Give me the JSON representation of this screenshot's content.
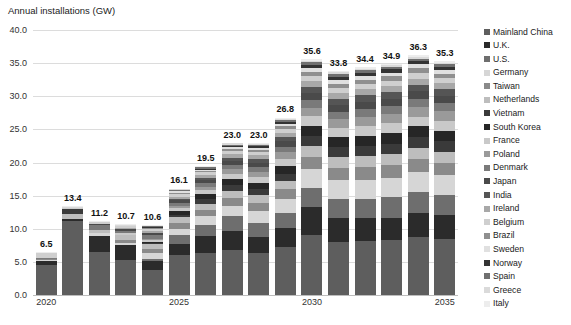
{
  "chart_data": {
    "type": "bar",
    "stacked": true,
    "title": "Annual installations (GW)",
    "xlabel": "",
    "ylabel": "Annual installations (GW)",
    "ylim": [
      0,
      40
    ],
    "ytick_step": 5,
    "ytick_labels": [
      "0.0",
      "5.0",
      "10.0",
      "15.0",
      "20.0",
      "25.0",
      "30.0",
      "35.0",
      "40.0"
    ],
    "grid": true,
    "legend_position": "right",
    "categories": [
      "2020",
      "2021",
      "2022",
      "2023",
      "2024",
      "2025",
      "2026",
      "2027",
      "2028",
      "2029",
      "2030",
      "2031",
      "2032",
      "2033",
      "2034",
      "2035"
    ],
    "xtick_labels_shown": [
      "2020",
      "2025",
      "2030",
      "2035"
    ],
    "totals": [
      6.5,
      13.4,
      11.2,
      10.7,
      10.6,
      16.1,
      19.5,
      23.0,
      23.0,
      26.8,
      35.6,
      33.8,
      34.4,
      34.9,
      36.3,
      35.3
    ],
    "total_labels": [
      "6.5",
      "13.4",
      "11.2",
      "10.7",
      "10.6",
      "16.1",
      "19.5",
      "23.0",
      "23.0",
      "26.8",
      "35.6",
      "33.8",
      "34.4",
      "34.9",
      "36.3",
      "35.3"
    ],
    "series": [
      {
        "name": "Mainland China",
        "color": "#5e5e5e",
        "values": [
          4.5,
          11.1,
          5.9,
          5.0,
          3.6,
          6.0,
          6.5,
          7.0,
          7.0,
          8.0,
          9.5,
          8.4,
          8.8,
          8.8,
          9.4,
          9.0
        ]
      },
      {
        "name": "U.K.",
        "color": "#2b2b2b",
        "values": [
          0.6,
          0.3,
          2.2,
          2.0,
          1.2,
          1.6,
          2.6,
          3.0,
          2.6,
          3.2,
          4.6,
          3.9,
          3.6,
          3.7,
          4.0,
          3.9
        ]
      },
      {
        "name": "U.S.",
        "color": "#6e6e6e",
        "values": [
          0.0,
          0.0,
          0.0,
          0.1,
          0.4,
          1.3,
          1.7,
          2.3,
          2.4,
          2.6,
          3.0,
          3.1,
          3.2,
          3.3,
          3.4,
          3.3
        ]
      },
      {
        "name": "Germany",
        "color": "#d6d6d6",
        "values": [
          0.2,
          0.0,
          0.3,
          0.3,
          0.8,
          1.0,
          1.3,
          1.6,
          2.0,
          2.3,
          3.0,
          3.0,
          3.1,
          3.1,
          3.2,
          3.1
        ]
      },
      {
        "name": "Taiwan",
        "color": "#8a8a8a",
        "values": [
          0.1,
          0.1,
          0.1,
          0.3,
          0.6,
          0.8,
          1.0,
          1.2,
          1.4,
          1.6,
          1.9,
          1.9,
          2.0,
          2.0,
          2.1,
          2.0
        ]
      },
      {
        "name": "Netherlands",
        "color": "#bdbdbd",
        "values": [
          0.0,
          0.7,
          0.4,
          0.7,
          0.7,
          0.9,
          1.0,
          1.1,
          1.2,
          1.4,
          1.8,
          1.7,
          1.8,
          1.8,
          1.9,
          1.8
        ]
      },
      {
        "name": "Vietnam",
        "color": "#3a3a3a",
        "values": [
          0.0,
          0.8,
          0.0,
          0.0,
          0.1,
          0.4,
          0.7,
          0.9,
          1.0,
          1.2,
          1.6,
          1.6,
          1.7,
          1.7,
          1.8,
          1.7
        ]
      },
      {
        "name": "South Korea",
        "color": "#262626",
        "values": [
          0.0,
          0.0,
          0.0,
          0.1,
          0.2,
          0.5,
          0.7,
          0.9,
          1.1,
          1.3,
          1.6,
          1.6,
          1.6,
          1.7,
          1.7,
          1.7
        ]
      },
      {
        "name": "France",
        "color": "#c9c9c9",
        "values": [
          0.0,
          0.0,
          0.0,
          0.2,
          0.3,
          0.5,
          0.7,
          0.9,
          1.0,
          1.2,
          1.5,
          1.5,
          1.5,
          1.6,
          1.6,
          1.6
        ]
      },
      {
        "name": "Poland",
        "color": "#9a9a9a",
        "values": [
          0.0,
          0.0,
          0.0,
          0.0,
          0.1,
          0.3,
          0.5,
          0.7,
          0.9,
          1.1,
          1.4,
          1.4,
          1.5,
          1.5,
          1.5,
          1.5
        ]
      },
      {
        "name": "Denmark",
        "color": "#7a7a7a",
        "values": [
          0.2,
          0.0,
          0.6,
          0.4,
          0.5,
          0.5,
          0.6,
          0.7,
          0.8,
          0.9,
          1.2,
          1.2,
          1.3,
          1.3,
          1.4,
          1.3
        ]
      },
      {
        "name": "Japan",
        "color": "#4a4a4a",
        "values": [
          0.0,
          0.0,
          0.1,
          0.2,
          0.3,
          0.4,
          0.5,
          0.6,
          0.7,
          0.9,
          1.1,
          1.1,
          1.2,
          1.2,
          1.2,
          1.2
        ]
      },
      {
        "name": "India",
        "color": "#555555",
        "values": [
          0.0,
          0.0,
          0.0,
          0.0,
          0.1,
          0.2,
          0.3,
          0.5,
          0.6,
          0.8,
          1.0,
          1.0,
          1.1,
          1.1,
          1.1,
          1.1
        ]
      },
      {
        "name": "Ireland",
        "color": "#a8a8a8",
        "values": [
          0.0,
          0.0,
          0.0,
          0.1,
          0.2,
          0.3,
          0.4,
          0.5,
          0.6,
          0.7,
          0.9,
          0.9,
          1.0,
          1.0,
          1.0,
          1.0
        ]
      },
      {
        "name": "Belgium",
        "color": "#cfcfcf",
        "values": [
          0.7,
          0.2,
          0.3,
          0.3,
          0.3,
          0.4,
          0.4,
          0.5,
          0.5,
          0.6,
          0.8,
          0.8,
          0.8,
          0.8,
          0.9,
          0.8
        ]
      },
      {
        "name": "Brazil",
        "color": "#8f8f8f",
        "values": [
          0.0,
          0.0,
          0.0,
          0.0,
          0.1,
          0.2,
          0.2,
          0.3,
          0.4,
          0.5,
          0.7,
          0.7,
          0.7,
          0.7,
          0.8,
          0.7
        ]
      },
      {
        "name": "Sweden",
        "color": "#e0e0e0",
        "values": [
          0.0,
          0.0,
          0.0,
          0.1,
          0.1,
          0.2,
          0.2,
          0.3,
          0.3,
          0.4,
          0.6,
          0.6,
          0.6,
          0.6,
          0.6,
          0.6
        ]
      },
      {
        "name": "Norway",
        "color": "#333333",
        "values": [
          0.0,
          0.0,
          0.0,
          0.0,
          0.1,
          0.1,
          0.2,
          0.2,
          0.3,
          0.3,
          0.5,
          0.5,
          0.5,
          0.5,
          0.5,
          0.5
        ]
      },
      {
        "name": "Spain",
        "color": "#707070",
        "values": [
          0.0,
          0.0,
          0.0,
          0.0,
          0.1,
          0.1,
          0.2,
          0.2,
          0.2,
          0.3,
          0.4,
          0.4,
          0.4,
          0.4,
          0.4,
          0.4
        ]
      },
      {
        "name": "Greece",
        "color": "#dadada",
        "values": [
          0.1,
          0.1,
          0.1,
          0.1,
          0.1,
          0.1,
          0.1,
          0.2,
          0.2,
          0.2,
          0.3,
          0.3,
          0.3,
          0.3,
          0.4,
          0.3
        ]
      },
      {
        "name": "Italy",
        "color": "#ededed",
        "values": [
          0.1,
          0.1,
          0.1,
          0.1,
          0.1,
          0.1,
          0.1,
          0.1,
          0.2,
          0.2,
          0.2,
          0.2,
          0.2,
          0.2,
          0.3,
          0.2
        ]
      }
    ]
  }
}
